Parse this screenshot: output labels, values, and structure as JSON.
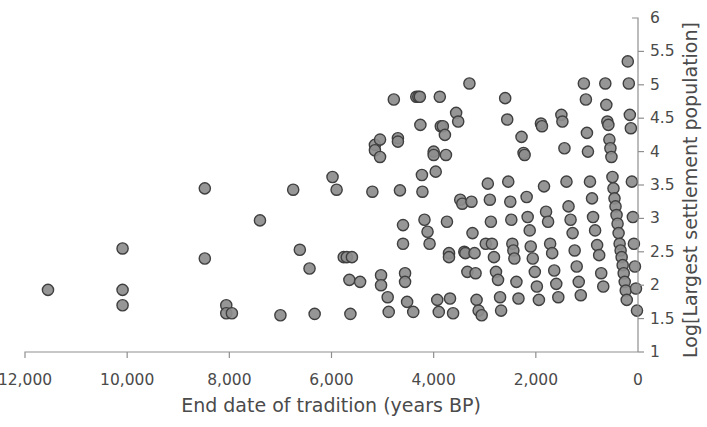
{
  "chart_data": {
    "type": "scatter",
    "title": "",
    "xlabel": "End date of tradition (years BP)",
    "ylabel": "Log[Largest settlement population]",
    "xlim": [
      12600,
      0
    ],
    "ylim": [
      1,
      6
    ],
    "x_inverted": true,
    "grid": false,
    "legend": null,
    "xticks": [
      12000,
      10000,
      8000,
      6000,
      4000,
      2000,
      0
    ],
    "xtick_labels": [
      "12,000",
      "10,000",
      "8,000",
      "6,000",
      "4,000",
      "2,000",
      "0"
    ],
    "yticks": [
      1,
      1.5,
      2,
      2.5,
      3,
      3.5,
      4,
      4.5,
      5,
      5.5,
      6
    ],
    "ytick_labels": [
      "1",
      "1.5",
      "2",
      "2.5",
      "3",
      "3.5",
      "4",
      "4.5",
      "5",
      "5.5",
      "6"
    ],
    "y_axis_position": "right",
    "marker": {
      "shape": "circle",
      "radius_px": 5.6,
      "fill": "#8d8d8d",
      "edge": "#3f3f3f"
    },
    "n_points": 174,
    "points": [
      [
        11550,
        1.93
      ],
      [
        10090,
        2.55
      ],
      [
        10090,
        1.93
      ],
      [
        10090,
        1.7
      ],
      [
        8060,
        1.7
      ],
      [
        8060,
        1.58
      ],
      [
        7950,
        1.58
      ],
      [
        8480,
        2.4
      ],
      [
        8480,
        3.45
      ],
      [
        7000,
        1.55
      ],
      [
        7400,
        2.97
      ],
      [
        6750,
        3.43
      ],
      [
        6620,
        2.53
      ],
      [
        6430,
        2.25
      ],
      [
        6330,
        1.57
      ],
      [
        5980,
        3.62
      ],
      [
        5900,
        3.43
      ],
      [
        5760,
        2.42
      ],
      [
        5700,
        2.42
      ],
      [
        5650,
        2.08
      ],
      [
        5630,
        1.57
      ],
      [
        5440,
        2.05
      ],
      [
        5600,
        2.42
      ],
      [
        5200,
        3.4
      ],
      [
        5150,
        4.1
      ],
      [
        5150,
        4.02
      ],
      [
        5050,
        4.18
      ],
      [
        5050,
        3.92
      ],
      [
        5030,
        2.15
      ],
      [
        5030,
        2.0
      ],
      [
        4900,
        1.82
      ],
      [
        4880,
        1.6
      ],
      [
        4780,
        4.78
      ],
      [
        4700,
        4.2
      ],
      [
        4700,
        4.15
      ],
      [
        4660,
        3.42
      ],
      [
        4600,
        2.9
      ],
      [
        4600,
        2.62
      ],
      [
        4560,
        2.18
      ],
      [
        4560,
        2.05
      ],
      [
        4520,
        1.75
      ],
      [
        4400,
        1.6
      ],
      [
        4340,
        4.82
      ],
      [
        4300,
        4.82
      ],
      [
        4270,
        4.82
      ],
      [
        4260,
        4.4
      ],
      [
        4230,
        3.65
      ],
      [
        4220,
        3.4
      ],
      [
        4180,
        2.98
      ],
      [
        4120,
        2.8
      ],
      [
        4080,
        2.62
      ],
      [
        4000,
        4.0
      ],
      [
        4000,
        3.95
      ],
      [
        3960,
        3.7
      ],
      [
        3930,
        1.78
      ],
      [
        3900,
        1.6
      ],
      [
        3880,
        4.82
      ],
      [
        3860,
        4.38
      ],
      [
        3820,
        4.38
      ],
      [
        3780,
        4.25
      ],
      [
        3760,
        3.95
      ],
      [
        3740,
        2.95
      ],
      [
        3700,
        2.48
      ],
      [
        3700,
        2.42
      ],
      [
        3680,
        1.8
      ],
      [
        3620,
        1.58
      ],
      [
        3560,
        4.58
      ],
      [
        3520,
        4.45
      ],
      [
        3480,
        3.28
      ],
      [
        3440,
        3.22
      ],
      [
        3400,
        2.5
      ],
      [
        3380,
        2.48
      ],
      [
        3340,
        2.2
      ],
      [
        3300,
        5.02
      ],
      [
        3260,
        3.25
      ],
      [
        3240,
        2.78
      ],
      [
        3200,
        2.48
      ],
      [
        3180,
        2.18
      ],
      [
        3160,
        1.78
      ],
      [
        3120,
        1.62
      ],
      [
        3060,
        1.55
      ],
      [
        2980,
        2.62
      ],
      [
        2940,
        3.52
      ],
      [
        2900,
        3.28
      ],
      [
        2880,
        2.95
      ],
      [
        2860,
        2.62
      ],
      [
        2820,
        2.42
      ],
      [
        2780,
        2.2
      ],
      [
        2740,
        2.08
      ],
      [
        2700,
        1.82
      ],
      [
        2680,
        1.62
      ],
      [
        2600,
        4.8
      ],
      [
        2560,
        4.48
      ],
      [
        2540,
        3.55
      ],
      [
        2500,
        3.25
      ],
      [
        2480,
        2.98
      ],
      [
        2460,
        2.62
      ],
      [
        2440,
        2.52
      ],
      [
        2420,
        2.4
      ],
      [
        2380,
        2.05
      ],
      [
        2340,
        1.8
      ],
      [
        2280,
        4.22
      ],
      [
        2240,
        3.98
      ],
      [
        2220,
        3.95
      ],
      [
        2180,
        3.32
      ],
      [
        2160,
        3.02
      ],
      [
        2120,
        2.82
      ],
      [
        2100,
        2.58
      ],
      [
        2060,
        2.4
      ],
      [
        2020,
        2.2
      ],
      [
        1980,
        1.98
      ],
      [
        1940,
        1.78
      ],
      [
        1900,
        4.42
      ],
      [
        1880,
        4.38
      ],
      [
        1840,
        3.48
      ],
      [
        1800,
        3.1
      ],
      [
        1760,
        2.95
      ],
      [
        1720,
        2.62
      ],
      [
        1680,
        2.48
      ],
      [
        1640,
        2.22
      ],
      [
        1600,
        2.02
      ],
      [
        1560,
        1.82
      ],
      [
        1500,
        4.55
      ],
      [
        1480,
        4.45
      ],
      [
        1440,
        4.05
      ],
      [
        1400,
        3.55
      ],
      [
        1360,
        3.18
      ],
      [
        1320,
        2.98
      ],
      [
        1280,
        2.78
      ],
      [
        1240,
        2.52
      ],
      [
        1200,
        2.28
      ],
      [
        1160,
        2.05
      ],
      [
        1120,
        1.85
      ],
      [
        1060,
        5.02
      ],
      [
        1020,
        4.78
      ],
      [
        1000,
        4.28
      ],
      [
        980,
        4.0
      ],
      [
        940,
        3.55
      ],
      [
        900,
        3.3
      ],
      [
        880,
        3.02
      ],
      [
        840,
        2.82
      ],
      [
        800,
        2.6
      ],
      [
        760,
        2.45
      ],
      [
        720,
        2.18
      ],
      [
        680,
        1.98
      ],
      [
        640,
        5.02
      ],
      [
        620,
        4.7
      ],
      [
        600,
        4.45
      ],
      [
        580,
        4.4
      ],
      [
        560,
        4.18
      ],
      [
        540,
        4.05
      ],
      [
        520,
        3.92
      ],
      [
        500,
        3.62
      ],
      [
        480,
        3.45
      ],
      [
        460,
        3.3
      ],
      [
        440,
        3.18
      ],
      [
        420,
        3.05
      ],
      [
        400,
        2.92
      ],
      [
        380,
        2.78
      ],
      [
        360,
        2.62
      ],
      [
        340,
        2.52
      ],
      [
        320,
        2.42
      ],
      [
        300,
        2.3
      ],
      [
        280,
        2.18
      ],
      [
        260,
        2.05
      ],
      [
        240,
        1.92
      ],
      [
        220,
        1.78
      ],
      [
        200,
        5.35
      ],
      [
        180,
        5.02
      ],
      [
        160,
        4.55
      ],
      [
        140,
        4.35
      ],
      [
        120,
        3.55
      ],
      [
        100,
        3.02
      ],
      [
        80,
        2.62
      ],
      [
        60,
        2.28
      ],
      [
        40,
        1.95
      ],
      [
        20,
        1.62
      ]
    ]
  }
}
